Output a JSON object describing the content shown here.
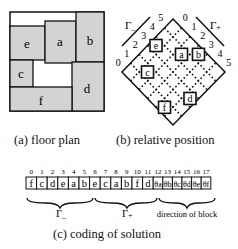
{
  "floor_plan": {
    "caption": "(a) floor plan",
    "fill_color": "#d3d3d3",
    "blocks": [
      {
        "label": "e"
      },
      {
        "label": "a"
      },
      {
        "label": "b"
      },
      {
        "label": "c"
      },
      {
        "label": "d"
      },
      {
        "label": "f"
      }
    ]
  },
  "relative_position": {
    "caption": "(b) relative position",
    "gamma_minus_label": "Γ",
    "gamma_minus_sub": "_",
    "gamma_plus_label": "Γ",
    "gamma_plus_sub": "+",
    "minus_axis_ticks": [
      "0",
      "1",
      "2",
      "3",
      "4",
      "5"
    ],
    "plus_axis_ticks": [
      "0",
      "1",
      "2",
      "3",
      "4",
      "5"
    ],
    "blocks": [
      {
        "label": "e",
        "minus_index": 3,
        "plus_index": 0
      },
      {
        "label": "a",
        "minus_index": 4,
        "plus_index": 2
      },
      {
        "label": "b",
        "minus_index": 5,
        "plus_index": 3
      },
      {
        "label": "c",
        "minus_index": 1,
        "plus_index": 1
      },
      {
        "label": "f",
        "minus_index": 0,
        "plus_index": 4
      },
      {
        "label": "d",
        "minus_index": 2,
        "plus_index": 5
      }
    ]
  },
  "coding": {
    "caption": "(c) coding of solution",
    "indices": [
      "0",
      "1",
      "2",
      "3",
      "4",
      "5",
      "6",
      "7",
      "8",
      "9",
      "10",
      "11",
      "12",
      "13",
      "14",
      "15",
      "16",
      "17"
    ],
    "cells": [
      "f",
      "c",
      "d",
      "e",
      "a",
      "b",
      "e",
      "c",
      "a",
      "b",
      "f",
      "d",
      "θa",
      "θb",
      "θc",
      "θd",
      "θe",
      "θf"
    ],
    "groups": [
      {
        "label": "Γ",
        "sub": "_"
      },
      {
        "label": "Γ",
        "sub": "+"
      },
      {
        "label": "direction of block",
        "sub": ""
      }
    ]
  }
}
